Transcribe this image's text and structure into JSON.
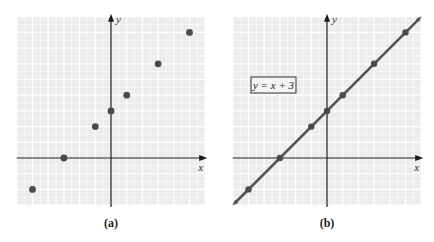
{
  "chart_data": [
    {
      "type": "scatter",
      "panel": "a",
      "caption": "(a)",
      "xlabel": "x",
      "ylabel": "y",
      "xlim": [
        -6,
        6
      ],
      "ylim": [
        -3,
        9
      ],
      "grid": true,
      "points": [
        {
          "x": -5,
          "y": -2
        },
        {
          "x": -3,
          "y": 0
        },
        {
          "x": -1,
          "y": 2
        },
        {
          "x": 0,
          "y": 3
        },
        {
          "x": 1,
          "y": 4
        },
        {
          "x": 3,
          "y": 6
        },
        {
          "x": 5,
          "y": 8
        }
      ]
    },
    {
      "type": "line",
      "panel": "b",
      "caption": "(b)",
      "xlabel": "x",
      "ylabel": "y",
      "xlim": [
        -6,
        6
      ],
      "ylim": [
        -3,
        9
      ],
      "grid": true,
      "equation_label": "y = x + 3",
      "line": {
        "slope": 1,
        "intercept": 3
      },
      "points": [
        {
          "x": -5,
          "y": -2
        },
        {
          "x": -3,
          "y": 0
        },
        {
          "x": -1,
          "y": 2
        },
        {
          "x": 0,
          "y": 3
        },
        {
          "x": 1,
          "y": 4
        },
        {
          "x": 3,
          "y": 6
        },
        {
          "x": 5,
          "y": 8
        }
      ]
    }
  ],
  "style": {
    "grid_bg": "#ececec",
    "grid_line": "#ffffff",
    "axis": "#1a1a1a",
    "point": "#4a4a4a",
    "line": "#555555"
  }
}
